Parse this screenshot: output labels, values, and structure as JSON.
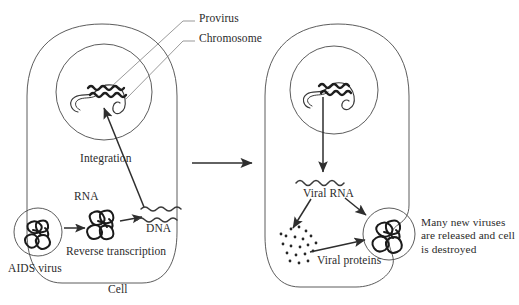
{
  "diagram": {
    "type": "biological-process-diagram",
    "stroke_color": "#3a3a3a",
    "text_color": "#2b2b2b",
    "background_color": "#ffffff"
  },
  "labels": {
    "provirus": "Provirus",
    "chromosome": "Chromosome",
    "integration": "Integration",
    "rna": "RNA",
    "dna": "DNA",
    "reverse_transcription": "Reverse transcription",
    "aids_virus": "AIDS virus",
    "cell": "Cell",
    "viral_rna": "Viral RNA",
    "viral_proteins": "Viral proteins",
    "outcome": "Many new viruses are released and cell is destroyed"
  },
  "stages": {
    "left_cell": {
      "name": "Infected cell — entry, reverse transcription and integration",
      "nucleus_contents": [
        "chromosome",
        "provirus"
      ]
    },
    "right_cell": {
      "name": "Infected cell — transcription, translation and release",
      "nucleus_contents": [
        "chromosome",
        "provirus"
      ],
      "products": [
        "viral_rna",
        "viral_proteins",
        "new_virus"
      ]
    }
  }
}
